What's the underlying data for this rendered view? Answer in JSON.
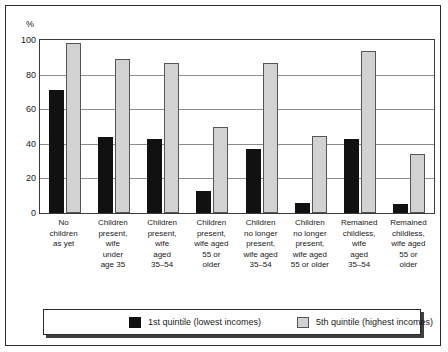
{
  "chart_data": {
    "type": "bar",
    "title": "",
    "xlabel": "",
    "ylabel": "%",
    "ylim": [
      0,
      100
    ],
    "yticks": [
      0,
      20,
      40,
      60,
      80,
      100
    ],
    "grid": true,
    "legend_position": "bottom",
    "categories": [
      "No children as yet",
      "Children present, wife under age 35",
      "Children present, wife aged 35–54",
      "Children present, wife aged 55 or older",
      "Children no longer present, wife aged 35–54",
      "Children no longer present, wife aged 55 or older",
      "Remained childless, wife aged 35–54",
      "Remained childless, wife aged 55 or older"
    ],
    "category_lines": [
      [
        "No",
        "children",
        "as yet"
      ],
      [
        "Children",
        "present,",
        "wife",
        "under",
        "age 35"
      ],
      [
        "Children",
        "present,",
        "wife",
        "aged",
        "35–54"
      ],
      [
        "Children",
        "present,",
        "wife aged",
        "55 or",
        "older"
      ],
      [
        "Children",
        "no longer",
        "present,",
        "wife aged",
        "35–54"
      ],
      [
        "Children",
        "no longer",
        "present,",
        "wife aged",
        "55 or older"
      ],
      [
        "Remained",
        "childless,",
        "wife",
        "aged",
        "35–54"
      ],
      [
        "Remained",
        "childless,",
        "wife aged",
        "55 or",
        "older"
      ]
    ],
    "series": [
      {
        "name": "1st quintile (lowest incomes)",
        "color": "#111111",
        "values": [
          71,
          44,
          43,
          12.5,
          37,
          6,
          43,
          5
        ]
      },
      {
        "name": "5th quintile (highest incomes)",
        "color": "#d2d2d2",
        "values": [
          98.5,
          89,
          87,
          49.5,
          87,
          44.5,
          93.5,
          34
        ]
      }
    ]
  },
  "legend": {
    "entries": [
      {
        "label": "1st quintile (lowest incomes)"
      },
      {
        "label": "5th quintile (highest incomes)"
      }
    ]
  }
}
